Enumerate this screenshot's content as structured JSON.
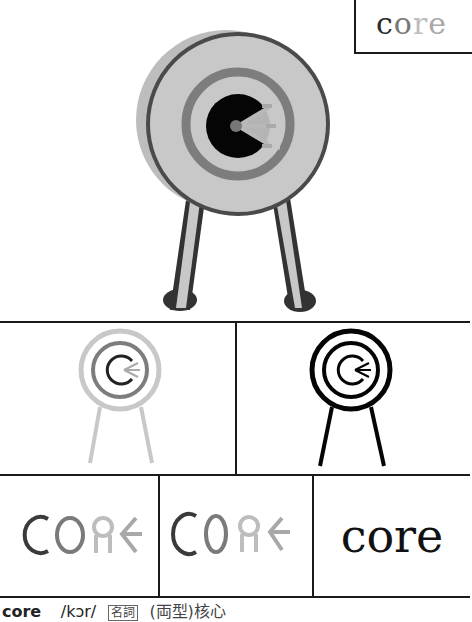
{
  "header": {
    "word": "core",
    "letters": [
      "c",
      "o",
      "r",
      "e"
    ]
  },
  "illustrations": {
    "main": {
      "name": "archery-target-color",
      "alt": "archery target on stand with arrows in bullseye"
    },
    "outline_gray": {
      "name": "archery-target-gray-outline"
    },
    "outline_black": {
      "name": "archery-target-black-outline"
    }
  },
  "logotypes": {
    "style1": {
      "letters": [
        "C",
        "O",
        "R",
        "E"
      ],
      "colors": [
        "#3a3a3a",
        "#7a7a7a",
        "#bdbdbd",
        "#a8a8a8"
      ]
    },
    "style2": {
      "letters": [
        "C",
        "O",
        "R",
        "E"
      ],
      "colors": [
        "#3a3a3a",
        "#7a7a7a",
        "#bdbdbd",
        "#a8a8a8"
      ]
    },
    "style3": {
      "text": "core"
    }
  },
  "footer": {
    "word": "core",
    "pronunciation": "/kɔr/",
    "part_of_speech": "名詞",
    "definition": "(両型)核心"
  },
  "colors": {
    "border": "#1a1a1a",
    "target_light": "#c8c8c8",
    "target_mid": "#7d7d7d",
    "target_dark": "#333333",
    "bullseye": "#050505"
  }
}
